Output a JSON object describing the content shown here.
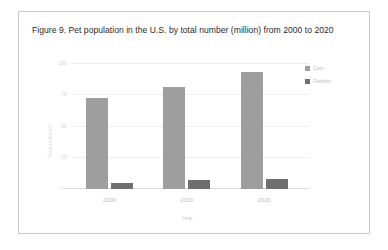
{
  "figure": {
    "caption": "Figure 9. Pet population in the U.S. by total number (million) from 2000 to 2020"
  },
  "colors": {
    "cats": "#9e9e9e",
    "rabbits": "#6f6f6f",
    "gridline": "#eeeeee",
    "axis": "#dcdcdc",
    "tick_text": "#c9c9c9",
    "card_border": "#c9c9c9"
  },
  "legend": {
    "position": "right",
    "items": [
      {
        "label": "Cats",
        "color": "#9e9e9e"
      },
      {
        "label": "Rabbits",
        "color": "#6f6f6f"
      }
    ]
  },
  "axes": {
    "x_title": "Year",
    "y_title": "Total (millions)",
    "y_ticks": [
      "100",
      "75",
      "50",
      "25"
    ],
    "x_ticks": [
      "2000",
      "2010",
      "2020"
    ]
  },
  "chart_data": {
    "type": "bar",
    "title": "Figure 9. Pet population in the U.S. by total number (million) from 2000 to 2020",
    "xlabel": "Year",
    "ylabel": "Total (millions)",
    "categories": [
      "2000",
      "2010",
      "2020"
    ],
    "series": [
      {
        "name": "Cats",
        "color": "#9e9e9e",
        "values": [
          73,
          82,
          94
        ]
      },
      {
        "name": "Rabbits",
        "color": "#6f6f6f",
        "values": [
          5,
          7,
          8
        ]
      }
    ],
    "ylim": [
      0,
      100
    ],
    "yticks": [
      25,
      50,
      75,
      100
    ],
    "grid": true,
    "legend_position": "right"
  }
}
